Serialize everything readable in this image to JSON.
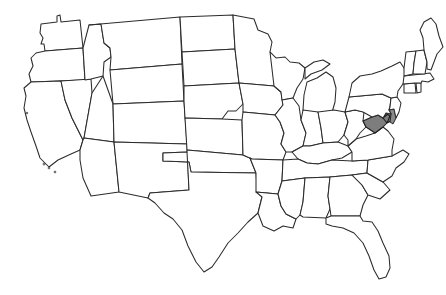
{
  "figure": {
    "kind": "choropleth-outline-map",
    "background_color": "#ffffff",
    "outline_color": "#2b2b2b",
    "default_state_fill": "#ffffff",
    "highlight_fill": "#7d7d7d",
    "width_px": 446,
    "height_px": 295,
    "projection_hint": "contiguous-united-states",
    "highlighted_states": [
      "Maryland",
      "Delaware"
    ],
    "legend": "",
    "caption": ""
  },
  "states": [
    {
      "code": "WA",
      "name": "Washington",
      "highlighted": false
    },
    {
      "code": "OR",
      "name": "Oregon",
      "highlighted": false
    },
    {
      "code": "CA",
      "name": "California",
      "highlighted": false
    },
    {
      "code": "NV",
      "name": "Nevada",
      "highlighted": false
    },
    {
      "code": "ID",
      "name": "Idaho",
      "highlighted": false
    },
    {
      "code": "MT",
      "name": "Montana",
      "highlighted": false
    },
    {
      "code": "WY",
      "name": "Wyoming",
      "highlighted": false
    },
    {
      "code": "UT",
      "name": "Utah",
      "highlighted": false
    },
    {
      "code": "AZ",
      "name": "Arizona",
      "highlighted": false
    },
    {
      "code": "CO",
      "name": "Colorado",
      "highlighted": false
    },
    {
      "code": "NM",
      "name": "New Mexico",
      "highlighted": false
    },
    {
      "code": "ND",
      "name": "North Dakota",
      "highlighted": false
    },
    {
      "code": "SD",
      "name": "South Dakota",
      "highlighted": false
    },
    {
      "code": "NE",
      "name": "Nebraska",
      "highlighted": false
    },
    {
      "code": "KS",
      "name": "Kansas",
      "highlighted": false
    },
    {
      "code": "OK",
      "name": "Oklahoma",
      "highlighted": false
    },
    {
      "code": "TX",
      "name": "Texas",
      "highlighted": false
    },
    {
      "code": "MN",
      "name": "Minnesota",
      "highlighted": false
    },
    {
      "code": "IA",
      "name": "Iowa",
      "highlighted": false
    },
    {
      "code": "MO",
      "name": "Missouri",
      "highlighted": false
    },
    {
      "code": "AR",
      "name": "Arkansas",
      "highlighted": false
    },
    {
      "code": "LA",
      "name": "Louisiana",
      "highlighted": false
    },
    {
      "code": "WI",
      "name": "Wisconsin",
      "highlighted": false
    },
    {
      "code": "IL",
      "name": "Illinois",
      "highlighted": false
    },
    {
      "code": "MI",
      "name": "Michigan",
      "highlighted": false
    },
    {
      "code": "IN",
      "name": "Indiana",
      "highlighted": false
    },
    {
      "code": "OH",
      "name": "Ohio",
      "highlighted": false
    },
    {
      "code": "KY",
      "name": "Kentucky",
      "highlighted": false
    },
    {
      "code": "TN",
      "name": "Tennessee",
      "highlighted": false
    },
    {
      "code": "MS",
      "name": "Mississippi",
      "highlighted": false
    },
    {
      "code": "AL",
      "name": "Alabama",
      "highlighted": false
    },
    {
      "code": "GA",
      "name": "Georgia",
      "highlighted": false
    },
    {
      "code": "FL",
      "name": "Florida",
      "highlighted": false
    },
    {
      "code": "SC",
      "name": "South Carolina",
      "highlighted": false
    },
    {
      "code": "NC",
      "name": "North Carolina",
      "highlighted": false
    },
    {
      "code": "VA",
      "name": "Virginia",
      "highlighted": false
    },
    {
      "code": "WV",
      "name": "West Virginia",
      "highlighted": false
    },
    {
      "code": "MD",
      "name": "Maryland",
      "highlighted": true
    },
    {
      "code": "DE",
      "name": "Delaware",
      "highlighted": true
    },
    {
      "code": "PA",
      "name": "Pennsylvania",
      "highlighted": false
    },
    {
      "code": "NJ",
      "name": "New Jersey",
      "highlighted": false
    },
    {
      "code": "NY",
      "name": "New York",
      "highlighted": false
    },
    {
      "code": "CT",
      "name": "Connecticut",
      "highlighted": false
    },
    {
      "code": "RI",
      "name": "Rhode Island",
      "highlighted": false
    },
    {
      "code": "MA",
      "name": "Massachusetts",
      "highlighted": false
    },
    {
      "code": "VT",
      "name": "Vermont",
      "highlighted": false
    },
    {
      "code": "NH",
      "name": "New Hampshire",
      "highlighted": false
    },
    {
      "code": "ME",
      "name": "Maine",
      "highlighted": false
    }
  ]
}
